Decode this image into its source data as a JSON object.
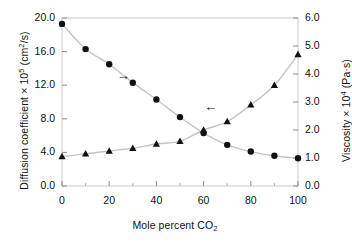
{
  "chart_data": {
    "type": "scatter",
    "title": "",
    "xlabel": "Mole percent CO2",
    "xlabel_parts": {
      "text": "Mole percent CO",
      "sub": "2"
    },
    "ylabel_left": "Diffusion coefficient × 10⁵ (cm²/s)",
    "ylabel_left_parts": {
      "pre": "Diffusion coefficient × 10",
      "sup": "5",
      "post": " (cm",
      "sup2": "2",
      "post2": "/s)"
    },
    "ylabel_right": "Viscosity × 10⁴ (Pa·s)",
    "ylabel_right_parts": {
      "pre": "Viscosity × 10",
      "sup": "4",
      "post": " (Pa·s)"
    },
    "x": [
      0,
      10,
      20,
      30,
      40,
      50,
      60,
      70,
      80,
      90,
      100
    ],
    "xlim": [
      0,
      100
    ],
    "xticks": [
      0,
      20,
      40,
      60,
      80,
      100
    ],
    "xticklabels": [
      "0",
      "20",
      "40",
      "60",
      "80",
      "100"
    ],
    "x_minor_ticks": [
      10,
      30,
      50,
      70,
      90
    ],
    "ylim_left": [
      0,
      20
    ],
    "yticks_left": [
      0,
      4,
      8,
      12,
      16,
      20
    ],
    "yticklabels_left": [
      "0.0",
      "4.0",
      "8.0",
      "12.0",
      "16.0",
      "20.0"
    ],
    "ylim_right": [
      0,
      6
    ],
    "yticks_right": [
      0,
      1,
      2,
      3,
      4,
      5,
      6
    ],
    "yticklabels_right": [
      "0.0",
      "1.0",
      "2.0",
      "3.0",
      "4.0",
      "5.0",
      "6.0"
    ],
    "grid": false,
    "legend": "none",
    "series": [
      {
        "name": "Diffusion coefficient",
        "marker": "circle",
        "axis": "left",
        "color": "#111111",
        "values": [
          19.3,
          16.3,
          14.5,
          12.3,
          10.3,
          8.2,
          6.3,
          4.9,
          4.1,
          3.6,
          3.3
        ]
      },
      {
        "name": "Viscosity",
        "marker": "triangle",
        "axis": "right",
        "color": "#111111",
        "values": [
          1.05,
          1.15,
          1.25,
          1.35,
          1.5,
          1.6,
          2.0,
          2.3,
          2.9,
          3.6,
          4.7
        ]
      }
    ],
    "annotations": [
      {
        "name": "arrow-to-right-axis",
        "symbol": "→",
        "x_data": 26,
        "y_left_data": 13.0
      },
      {
        "name": "arrow-to-left-axis",
        "symbol": "←",
        "x_data": 63,
        "y_left_data": 9.3
      }
    ]
  }
}
